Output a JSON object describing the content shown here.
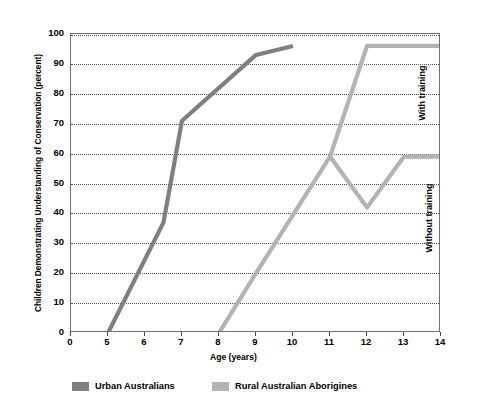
{
  "chart_data": {
    "type": "line",
    "title": "",
    "xlabel": "Age (years)",
    "ylabel": "Children Demonstrating Understanding of Conservation (percent)",
    "xlim": [
      0,
      14
    ],
    "ylim": [
      0,
      100
    ],
    "x_ticks": [
      "0",
      "5",
      "6",
      "7",
      "8",
      "9",
      "10",
      "11",
      "12",
      "13",
      "14"
    ],
    "x_tick_values": [
      0,
      5,
      6,
      7,
      8,
      9,
      10,
      11,
      12,
      13,
      14
    ],
    "y_ticks": [
      "0",
      "10",
      "20",
      "30",
      "40",
      "50",
      "60",
      "70",
      "80",
      "90",
      "100"
    ],
    "y_tick_values": [
      0,
      10,
      20,
      30,
      40,
      50,
      60,
      70,
      80,
      90,
      100
    ],
    "grid": true,
    "grid_axis": "y",
    "legend_position": "bottom",
    "series": [
      {
        "name": "Urban Australians",
        "color": "#7f7f7f",
        "points": [
          {
            "x": 5,
            "y": 0
          },
          {
            "x": 6.5,
            "y": 37
          },
          {
            "x": 7,
            "y": 71
          },
          {
            "x": 9,
            "y": 93
          },
          {
            "x": 10,
            "y": 96
          }
        ]
      },
      {
        "name": "Rural Australian Aborigines",
        "color": "#b3b3b3",
        "points": [
          {
            "x": 8,
            "y": 0
          },
          {
            "x": 9,
            "y": 20
          },
          {
            "x": 11,
            "y": 59
          },
          {
            "x": 12,
            "y": 42
          },
          {
            "x": 13,
            "y": 59
          },
          {
            "x": 14,
            "y": 59
          }
        ],
        "branch_points": [
          {
            "x": 11,
            "y": 59
          },
          {
            "x": 12,
            "y": 96
          },
          {
            "x": 14,
            "y": 96
          }
        ]
      }
    ],
    "annotations": [
      {
        "text": "With training",
        "x": 14,
        "y": 80,
        "rotation": -90
      },
      {
        "text": "Without training",
        "x": 14,
        "y": 38,
        "rotation": -90
      }
    ]
  },
  "legend": {
    "items": [
      {
        "label": "Urban Australians",
        "color": "#7f7f7f"
      },
      {
        "label": "Rural Australian Aborigines",
        "color": "#b3b3b3"
      }
    ]
  }
}
